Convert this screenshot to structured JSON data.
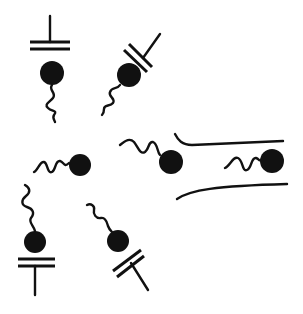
{
  "diagram": {
    "title": "",
    "ink_color": "#111111",
    "background": "#ffffff",
    "elements": [
      {
        "id": "bound-ligand-top-left",
        "type": "ligand-receptor-complex",
        "head": {
          "cx": 52,
          "cy": 73,
          "r": 12
        }
      },
      {
        "id": "bound-ligand-top-middle",
        "type": "ligand-receptor-complex",
        "head": {
          "cx": 129,
          "cy": 75,
          "r": 12
        }
      },
      {
        "id": "free-ligand-left",
        "type": "free-ligand",
        "head": {
          "cx": 80,
          "cy": 165,
          "r": 11
        }
      },
      {
        "id": "ligand-entering-channel",
        "type": "free-ligand",
        "head": {
          "cx": 171,
          "cy": 162,
          "r": 12
        }
      },
      {
        "id": "ligand-inside-channel",
        "type": "free-ligand",
        "head": {
          "cx": 272,
          "cy": 161,
          "r": 12
        }
      },
      {
        "id": "channel",
        "type": "channel-walls"
      },
      {
        "id": "bound-ligand-bottom-left",
        "type": "ligand-receptor-complex",
        "head": {
          "cx": 35,
          "cy": 242,
          "r": 11
        }
      },
      {
        "id": "bound-ligand-bottom-middle",
        "type": "ligand-receptor-complex",
        "head": {
          "cx": 118,
          "cy": 241,
          "r": 11
        }
      }
    ]
  }
}
